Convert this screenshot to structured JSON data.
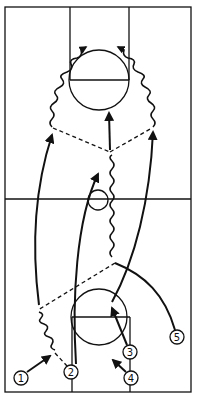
{
  "diagram": {
    "type": "basketball-play",
    "ink_color": "#111111",
    "background": "#ffffff",
    "court": {
      "x": 5,
      "y": 7,
      "width": 186,
      "height": 385,
      "midline_y": 199,
      "center_circle": {
        "cx": 98,
        "cy": 200,
        "r": 10
      },
      "top_key": {
        "lane_left_x": 70,
        "lane_right_x": 129,
        "free_throw_y": 80,
        "circle": {
          "cx": 99,
          "cy": 80,
          "r": 30
        }
      },
      "bottom_key": {
        "lane_left_x": 72,
        "lane_right_x": 130,
        "free_throw_y": 317,
        "circle": {
          "cx": 99,
          "cy": 317,
          "r": 28
        }
      }
    },
    "players": [
      {
        "id": "1",
        "label": "1",
        "cx": 21,
        "cy": 378
      },
      {
        "id": "2",
        "label": "2",
        "cx": 71,
        "cy": 372
      },
      {
        "id": "3",
        "label": "3",
        "cx": 130,
        "cy": 352
      },
      {
        "id": "4",
        "label": "4",
        "cx": 131,
        "cy": 378
      },
      {
        "id": "5",
        "label": "5",
        "cx": 177,
        "cy": 337
      }
    ],
    "legend": {
      "solid_arrow": "cut / player movement",
      "wavy_arrow": "dribble",
      "dashed_line": "pass"
    }
  }
}
